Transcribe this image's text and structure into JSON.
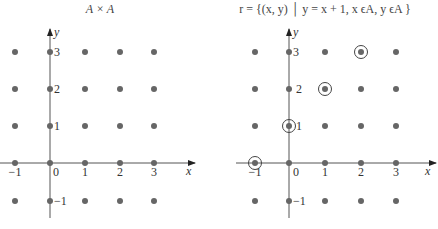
{
  "figure": {
    "panels": [
      {
        "id": "left",
        "title": "A × A",
        "x_axis_label": "x",
        "y_axis_label": "y",
        "x_ticks": [
          "−1",
          "0",
          "1",
          "2",
          "3"
        ],
        "y_ticks": [
          "3",
          "2",
          "1",
          "−1"
        ]
      },
      {
        "id": "right",
        "title": "r = {(x, y) │ y = x + 1, x ϵA, y ϵA }",
        "x_axis_label": "x",
        "y_axis_label": "y",
        "x_ticks": [
          "−1",
          "0",
          "1",
          "2",
          "3"
        ],
        "y_ticks": [
          "3",
          "2",
          "1",
          "−1"
        ]
      }
    ]
  },
  "chart_data": [
    {
      "type": "scatter",
      "title": "A × A",
      "xlabel": "x",
      "ylabel": "y",
      "xlim": [
        -1,
        3
      ],
      "ylim": [
        -1,
        3
      ],
      "set_A": [
        -1,
        0,
        1,
        2,
        3
      ],
      "points": [
        [
          -1,
          3
        ],
        [
          0,
          3
        ],
        [
          1,
          3
        ],
        [
          2,
          3
        ],
        [
          3,
          3
        ],
        [
          -1,
          2
        ],
        [
          0,
          2
        ],
        [
          1,
          2
        ],
        [
          2,
          2
        ],
        [
          3,
          2
        ],
        [
          -1,
          1
        ],
        [
          0,
          1
        ],
        [
          1,
          1
        ],
        [
          2,
          1
        ],
        [
          3,
          1
        ],
        [
          -1,
          0
        ],
        [
          0,
          0
        ],
        [
          1,
          0
        ],
        [
          2,
          0
        ],
        [
          3,
          0
        ],
        [
          -1,
          -1
        ],
        [
          0,
          -1
        ],
        [
          1,
          -1
        ],
        [
          2,
          -1
        ],
        [
          3,
          -1
        ]
      ],
      "highlighted": []
    },
    {
      "type": "scatter",
      "title": "r = {(x, y) | y = x + 1, x ϵA, y ϵA }",
      "xlabel": "x",
      "ylabel": "y",
      "xlim": [
        -1,
        3
      ],
      "ylim": [
        -1,
        3
      ],
      "set_A": [
        -1,
        0,
        1,
        2,
        3
      ],
      "points": [
        [
          -1,
          3
        ],
        [
          0,
          3
        ],
        [
          1,
          3
        ],
        [
          2,
          3
        ],
        [
          3,
          3
        ],
        [
          -1,
          2
        ],
        [
          0,
          2
        ],
        [
          1,
          2
        ],
        [
          2,
          2
        ],
        [
          3,
          2
        ],
        [
          -1,
          1
        ],
        [
          0,
          1
        ],
        [
          1,
          1
        ],
        [
          2,
          1
        ],
        [
          3,
          1
        ],
        [
          -1,
          0
        ],
        [
          0,
          0
        ],
        [
          1,
          0
        ],
        [
          2,
          0
        ],
        [
          3,
          0
        ],
        [
          -1,
          -1
        ],
        [
          0,
          -1
        ],
        [
          1,
          -1
        ],
        [
          2,
          -1
        ],
        [
          3,
          -1
        ]
      ],
      "highlighted": [
        [
          -1,
          0
        ],
        [
          0,
          1
        ],
        [
          1,
          2
        ],
        [
          2,
          3
        ]
      ]
    }
  ]
}
